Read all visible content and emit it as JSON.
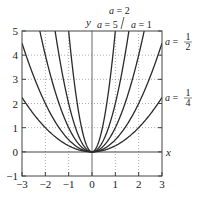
{
  "chart_data": {
    "type": "line",
    "title": "",
    "function": "y = a x^2",
    "xlabel": "x",
    "ylabel": "y",
    "xlim": [
      -3,
      3
    ],
    "ylim": [
      -1,
      5
    ],
    "xticks": [
      -3,
      -2,
      -1,
      0,
      1,
      2,
      3
    ],
    "yticks": [
      -1,
      0,
      1,
      2,
      3,
      4,
      5
    ],
    "grid": true,
    "grid_style": "dotted",
    "legend": "inline labels",
    "series": [
      {
        "name": "a = 5",
        "a": 5,
        "label": "a = 5"
      },
      {
        "name": "a = 2",
        "a": 2,
        "label": "a = 2"
      },
      {
        "name": "a = 1",
        "a": 1,
        "label": "a = 1"
      },
      {
        "name": "a = 1/2",
        "a": 0.5,
        "label": "a = 1/2"
      },
      {
        "name": "a = 1/4",
        "a": 0.25,
        "label": "a = 1/4"
      }
    ]
  },
  "labels": {
    "x_axis": "x",
    "y_axis": "y",
    "a5": {
      "var": "a",
      "eq": " = 5"
    },
    "a2": {
      "var": "a",
      "eq": " = 2"
    },
    "a1": {
      "var": "a",
      "eq": " = 1"
    },
    "ahalf": {
      "var": "a",
      "eq": " = ",
      "num": "1",
      "den": "2"
    },
    "aquarter": {
      "var": "a",
      "eq": " = ",
      "num": "1",
      "den": "4"
    }
  },
  "ticks": {
    "x": [
      "−3",
      "−2",
      "−1",
      "0",
      "1",
      "2",
      "3"
    ],
    "y": [
      "−1",
      "0",
      "1",
      "2",
      "3",
      "4",
      "5"
    ]
  },
  "colors": {
    "curve": "#2a2a2a",
    "axis": "#555555",
    "frame": "#444444",
    "grid": "#9a9a9a"
  }
}
